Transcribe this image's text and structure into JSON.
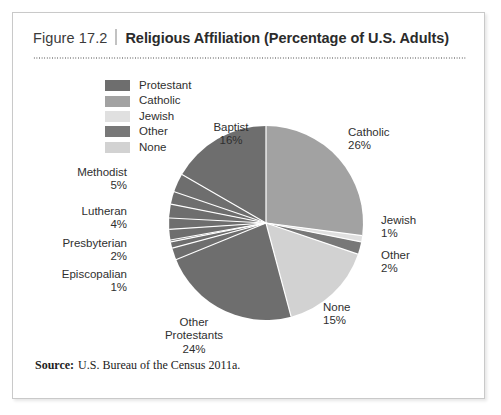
{
  "figure": {
    "number": "Figure 17.2",
    "title": "Religious Affiliation (Percentage of U.S. Adults)",
    "source_label": "Source:",
    "source_text": "U.S. Bureau of the Census 2011a."
  },
  "legend": {
    "items": [
      {
        "label": "Protestant",
        "color": "#6e6e6e"
      },
      {
        "label": "Catholic",
        "color": "#a2a2a2"
      },
      {
        "label": "Jewish",
        "color": "#e0e0e0"
      },
      {
        "label": "Other",
        "color": "#787878"
      },
      {
        "label": "None",
        "color": "#d2d2d2"
      }
    ]
  },
  "callouts": {
    "baptist": {
      "name": "Baptist",
      "pct": "16%"
    },
    "methodist": {
      "name": "Methodist",
      "pct": "5%"
    },
    "lutheran": {
      "name": "Lutheran",
      "pct": "4%"
    },
    "presbyterian": {
      "name": "Presbyterian",
      "pct": "2%"
    },
    "episcopalian": {
      "name": "Episcopalian",
      "pct": "1%"
    },
    "other_prot_l1": {
      "name": "Other",
      "name2": "Protestants",
      "pct": "24%"
    },
    "none": {
      "name": "None",
      "pct": "15%"
    },
    "other": {
      "name": "Other",
      "pct": "2%"
    },
    "jewish": {
      "name": "Jewish",
      "pct": "1%"
    },
    "catholic": {
      "name": "Catholic",
      "pct": "26%"
    }
  },
  "chart_data": {
    "type": "pie",
    "title": "Religious Affiliation (Percentage of U.S. Adults)",
    "units": "percent of U.S. adults",
    "legend_position": "top-left",
    "start_angle_deg": 0,
    "direction": "clockwise",
    "labels": [
      "Catholic",
      "Jewish",
      "Other",
      "None",
      "Other Protestants",
      "Episcopalian",
      "Presbyterian",
      "Lutheran",
      "Methodist",
      "Baptist"
    ],
    "values": [
      26,
      1,
      2,
      15,
      24,
      1,
      2,
      4,
      5,
      16
    ],
    "colors": [
      "#a2a2a2",
      "#e0e0e0",
      "#787878",
      "#d2d2d2",
      "#6e6e6e",
      "#6e6e6e",
      "#6e6e6e",
      "#6e6e6e",
      "#6e6e6e",
      "#6e6e6e"
    ],
    "groups": {
      "Protestant": {
        "total": 52,
        "members": [
          "Baptist",
          "Methodist",
          "Lutheran",
          "Presbyterian",
          "Episcopalian",
          "Other Protestants"
        ]
      },
      "Catholic": {
        "total": 26
      },
      "Jewish": {
        "total": 1
      },
      "Other": {
        "total": 2
      },
      "None": {
        "total": 15
      }
    },
    "source": "U.S. Bureau of the Census 2011a."
  }
}
